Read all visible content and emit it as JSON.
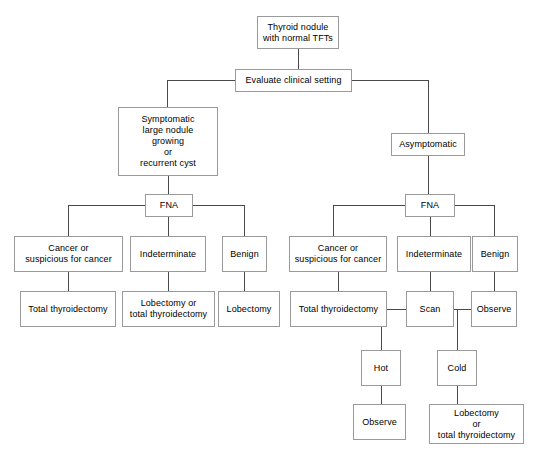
{
  "diagram": {
    "type": "flowchart",
    "colors": {
      "background": "#ffffff",
      "box_border": "#9a9a9a",
      "connector": "#4a4a4a",
      "text": "#000000"
    },
    "nodes": [
      {
        "id": "root",
        "label": "Thyroid nodule\nwith normal TFTs",
        "x": 257,
        "y": 16,
        "w": 82,
        "h": 33
      },
      {
        "id": "evaluate",
        "label": "Evaluate clinical setting",
        "x": 235,
        "y": 69,
        "w": 117,
        "h": 23
      },
      {
        "id": "symptomatic",
        "label": "Symptomatic\nlarge nodule\ngrowing\nor\nrecurrent cyst",
        "x": 118,
        "y": 107,
        "w": 100,
        "h": 69
      },
      {
        "id": "asymptomatic",
        "label": "Asymptomatic",
        "x": 391,
        "y": 133,
        "w": 74,
        "h": 23
      },
      {
        "id": "fna-left",
        "label": "FNA",
        "x": 145,
        "y": 194,
        "w": 48,
        "h": 23
      },
      {
        "id": "fna-right",
        "label": "FNA",
        "x": 405,
        "y": 194,
        "w": 50,
        "h": 23
      },
      {
        "id": "l-cancer",
        "label": "Cancer or\nsuspicious for cancer",
        "x": 14,
        "y": 236,
        "w": 109,
        "h": 36
      },
      {
        "id": "l-indeterminate",
        "label": "Indeterminate",
        "x": 130,
        "y": 236,
        "w": 76,
        "h": 36
      },
      {
        "id": "l-benign",
        "label": "Benign",
        "x": 222,
        "y": 236,
        "w": 45,
        "h": 36
      },
      {
        "id": "l-total-thy",
        "label": "Total thyroidectomy",
        "x": 20,
        "y": 291,
        "w": 96,
        "h": 36
      },
      {
        "id": "l-lobe-or-total",
        "label": "Lobectomy or\ntotal thyroidectomy",
        "x": 122,
        "y": 291,
        "w": 93,
        "h": 36
      },
      {
        "id": "l-lobectomy",
        "label": "Lobectomy",
        "x": 218,
        "y": 291,
        "w": 62,
        "h": 36
      },
      {
        "id": "r-cancer",
        "label": "Cancer or\nsuspicious for cancer",
        "x": 289,
        "y": 236,
        "w": 98,
        "h": 36
      },
      {
        "id": "r-indeterminate",
        "label": "Indeterminate",
        "x": 397,
        "y": 236,
        "w": 74,
        "h": 36
      },
      {
        "id": "r-benign",
        "label": "Benign",
        "x": 472,
        "y": 236,
        "w": 46,
        "h": 36
      },
      {
        "id": "r-total-thy",
        "label": "Total thyroidectomy",
        "x": 290,
        "y": 291,
        "w": 97,
        "h": 36
      },
      {
        "id": "scan",
        "label": "Scan",
        "x": 406,
        "y": 291,
        "w": 48,
        "h": 36
      },
      {
        "id": "r-observe",
        "label": "Observe",
        "x": 471,
        "y": 291,
        "w": 46,
        "h": 36
      },
      {
        "id": "hot",
        "label": "Hot",
        "x": 361,
        "y": 350,
        "w": 40,
        "h": 36
      },
      {
        "id": "cold",
        "label": "Cold",
        "x": 437,
        "y": 350,
        "w": 40,
        "h": 36
      },
      {
        "id": "hot-observe",
        "label": "Observe",
        "x": 353,
        "y": 404,
        "w": 53,
        "h": 36
      },
      {
        "id": "cold-lobe",
        "label": "Lobectomy\nor\ntotal thyroidectomy",
        "x": 429,
        "y": 404,
        "w": 95,
        "h": 40
      }
    ],
    "edges": [
      {
        "from": "root",
        "to": "evaluate",
        "type": "v",
        "x": 298,
        "y": 49,
        "len": 20
      },
      {
        "from": "evaluate",
        "to": "branch-bus",
        "type": "h",
        "x": 167,
        "y": 80,
        "len": 68
      },
      {
        "from": "evaluate",
        "to": "symptomatic",
        "type": "v",
        "x": 167,
        "y": 80,
        "len": 27
      },
      {
        "from": "evaluate",
        "to": "branch-bus-r",
        "type": "h",
        "x": 352,
        "y": 80,
        "len": 76
      },
      {
        "from": "evaluate",
        "to": "asymptomatic",
        "type": "v",
        "x": 428,
        "y": 80,
        "len": 53
      },
      {
        "from": "symptomatic",
        "to": "fna-left",
        "type": "v",
        "x": 168,
        "y": 176,
        "len": 18
      },
      {
        "from": "asymptomatic",
        "to": "fna-right",
        "type": "v",
        "x": 428,
        "y": 156,
        "len": 38
      },
      {
        "from": "fna-left",
        "to": "bus-left-l",
        "type": "h",
        "x": 68,
        "y": 205,
        "len": 77
      },
      {
        "from": "fna-left",
        "to": "l-cancer",
        "type": "v",
        "x": 68,
        "y": 205,
        "len": 31
      },
      {
        "from": "fna-left",
        "to": "l-indeterminate",
        "type": "v",
        "x": 168,
        "y": 217,
        "len": 19
      },
      {
        "from": "fna-left",
        "to": "bus-left-r",
        "type": "h",
        "x": 193,
        "y": 205,
        "len": 51
      },
      {
        "from": "fna-left",
        "to": "l-benign",
        "type": "v",
        "x": 244,
        "y": 205,
        "len": 31
      },
      {
        "from": "fna-right",
        "to": "bus-right-l",
        "type": "h",
        "x": 333,
        "y": 205,
        "len": 72
      },
      {
        "from": "fna-right",
        "to": "r-cancer",
        "type": "v",
        "x": 333,
        "y": 205,
        "len": 31
      },
      {
        "from": "fna-right",
        "to": "r-indeterminate",
        "type": "v",
        "x": 430,
        "y": 217,
        "len": 19
      },
      {
        "from": "fna-right",
        "to": "bus-right-r",
        "type": "h",
        "x": 455,
        "y": 205,
        "len": 40
      },
      {
        "from": "fna-right",
        "to": "r-benign",
        "type": "v",
        "x": 494,
        "y": 205,
        "len": 31
      },
      {
        "from": "l-cancer",
        "to": "l-total-thy",
        "type": "v",
        "x": 68,
        "y": 272,
        "len": 19
      },
      {
        "from": "l-indeterminate",
        "to": "l-lobe-or-total",
        "type": "v",
        "x": 168,
        "y": 272,
        "len": 19
      },
      {
        "from": "l-benign",
        "to": "l-lobectomy",
        "type": "v",
        "x": 244,
        "y": 272,
        "len": 19
      },
      {
        "from": "r-cancer",
        "to": "r-total-thy",
        "type": "v",
        "x": 338,
        "y": 272,
        "len": 19
      },
      {
        "from": "r-indeterminate",
        "to": "scan",
        "type": "v",
        "x": 430,
        "y": 272,
        "len": 19
      },
      {
        "from": "r-benign",
        "to": "r-observe",
        "type": "v",
        "x": 494,
        "y": 272,
        "len": 19
      },
      {
        "from": "scan",
        "to": "hot-bus",
        "type": "h",
        "x": 381,
        "y": 309,
        "len": 25
      },
      {
        "from": "scan",
        "to": "hot",
        "type": "v",
        "x": 381,
        "y": 309,
        "len": 41
      },
      {
        "from": "scan",
        "to": "cold-bus",
        "type": "h",
        "x": 454,
        "y": 309,
        "len": 24
      },
      {
        "from": "scan",
        "to": "cold",
        "type": "v",
        "x": 457,
        "y": 309,
        "len": 41
      },
      {
        "from": "hot",
        "to": "hot-observe",
        "type": "v",
        "x": 381,
        "y": 386,
        "len": 18
      },
      {
        "from": "cold",
        "to": "cold-lobe",
        "type": "v",
        "x": 457,
        "y": 386,
        "len": 18
      }
    ]
  }
}
